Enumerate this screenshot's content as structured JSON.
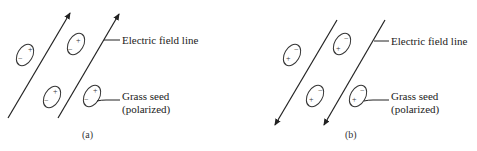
{
  "figure": {
    "colors": {
      "stroke": "#222222",
      "background": "#ffffff"
    },
    "panels": [
      {
        "id": "a",
        "caption": "(a)",
        "field_direction": "up",
        "field_line_label": "Electric field line",
        "seed_label_line1": "Grass seed",
        "seed_label_line2": "(polarized)",
        "seed_top_sign": "+",
        "seed_bottom_sign": "−"
      },
      {
        "id": "b",
        "caption": "(b)",
        "field_direction": "down",
        "field_line_label": "Electric field line",
        "seed_label_line1": "Grass seed",
        "seed_label_line2": "(polarized)",
        "seed_top_sign": "−",
        "seed_bottom_sign": "+"
      }
    ]
  }
}
